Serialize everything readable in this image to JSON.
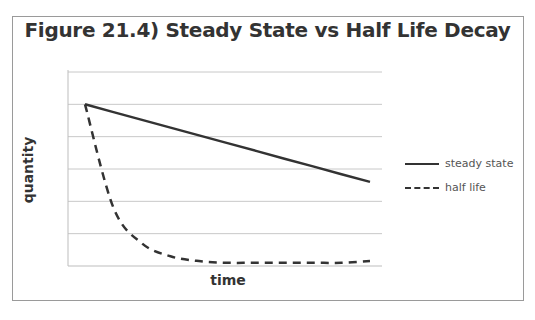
{
  "chart_data": {
    "type": "line",
    "title": "Figure 21.4) Steady State vs Half Life Decay",
    "xlabel": "time",
    "ylabel": "quantity",
    "ylim": [
      0,
      6
    ],
    "grid": true,
    "legend_position": "right",
    "x": [
      0,
      1,
      2,
      3,
      4,
      5,
      6,
      7,
      8,
      9,
      10
    ],
    "series": [
      {
        "name": "steady state",
        "style": "solid",
        "values": [
          5.0,
          4.76,
          4.52,
          4.28,
          4.04,
          3.8,
          3.56,
          3.32,
          3.08,
          2.84,
          2.6
        ]
      },
      {
        "name": "half life",
        "style": "dashed",
        "values": [
          5.0,
          1.8,
          0.7,
          0.3,
          0.15,
          0.1,
          0.1,
          0.1,
          0.1,
          0.1,
          0.15
        ]
      }
    ],
    "colors": {
      "line": "#333333",
      "grid": "#c8c8c8"
    }
  }
}
